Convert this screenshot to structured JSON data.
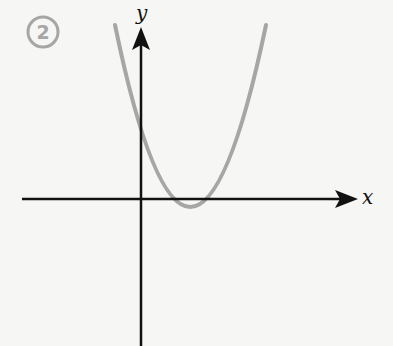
{
  "figure": {
    "number_label": "2",
    "x_axis_label": "x",
    "y_axis_label": "y",
    "curve": "upward parabola with two positive roots and minimum below x-axis",
    "colors": {
      "background": "#f6f6f5",
      "axes": "#111111",
      "curve": "#a6a6a6",
      "badge": "#a6a6a6"
    }
  }
}
